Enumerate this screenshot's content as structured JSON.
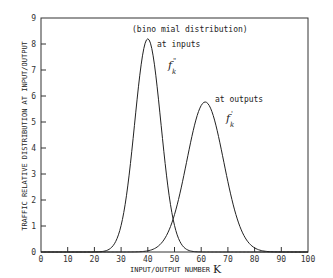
{
  "chart_data": {
    "type": "line",
    "title": "",
    "xlabel": "INPUT/OUTPUT NUMBER",
    "xlabel_symbol": "K",
    "ylabel": "TRAFFIC RELATIVE DISTRIBUTION AT INPUT/OUTPUT",
    "xlim": [
      0,
      100
    ],
    "ylim": [
      0,
      9
    ],
    "x_ticks": [
      0,
      10,
      20,
      30,
      40,
      50,
      60,
      70,
      80,
      90,
      100
    ],
    "y_ticks": [
      0,
      1,
      2,
      3,
      4,
      5,
      6,
      7,
      8,
      9
    ],
    "grid": false,
    "legend": "none (inline annotations)",
    "annotations": [
      {
        "text": "(bino mial distribution)",
        "x": 34,
        "y": 8.3
      },
      {
        "text": "at inputs",
        "x": 43,
        "y": 7.8
      },
      {
        "text": "f",
        "sup": "\"",
        "sub": "k",
        "x": 48,
        "y": 7.1,
        "series": "at inputs"
      },
      {
        "text": "at outputs",
        "x": 65,
        "y": 5.8
      },
      {
        "text": "f",
        "sup": "'",
        "sub": "k",
        "x": 67,
        "y": 5.1,
        "series": "at outputs"
      }
    ],
    "series": [
      {
        "name": "at inputs",
        "label": "f''_k",
        "shape": "binomial/gaussian",
        "peak_x": 40,
        "peak_y": 8.2,
        "sigma": 4.9,
        "x": [
          20,
          25,
          28,
          30,
          32,
          34,
          36,
          38,
          40,
          42,
          44,
          46,
          48,
          50,
          52,
          55,
          60
        ],
        "values": [
          0.0,
          0.08,
          0.4,
          0.98,
          1.97,
          3.4,
          5.1,
          7.0,
          8.2,
          7.0,
          5.1,
          3.4,
          1.97,
          0.98,
          0.4,
          0.08,
          0.0
        ]
      },
      {
        "name": "at outputs",
        "label": "f'_k",
        "shape": "binomial/gaussian",
        "peak_x": 61.5,
        "peak_y": 5.77,
        "sigma": 6.9,
        "x": [
          35,
          40,
          45,
          48,
          50,
          52,
          55,
          58,
          61.5,
          65,
          68,
          71,
          75,
          78,
          82,
          88
        ],
        "values": [
          0.04,
          0.4,
          0.94,
          1.7,
          2.3,
          3.0,
          3.97,
          5.2,
          5.77,
          5.2,
          3.97,
          2.64,
          1.3,
          0.9,
          0.1,
          0.02
        ]
      }
    ]
  }
}
